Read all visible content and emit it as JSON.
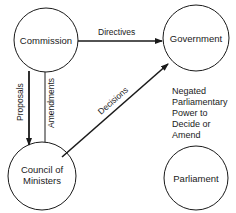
{
  "diagram": {
    "nodes": [
      {
        "id": "commission",
        "label": "Commission"
      },
      {
        "id": "government",
        "label": "Government"
      },
      {
        "id": "council",
        "label_lines": [
          "Council of",
          "Ministers"
        ]
      },
      {
        "id": "parliament",
        "label": "Parliament"
      }
    ],
    "edges": [
      {
        "from": "commission",
        "to": "government",
        "label": "Directives"
      },
      {
        "from": "commission",
        "to": "council",
        "label": "Proposals"
      },
      {
        "from": "council",
        "to": "commission",
        "label": "Amendments"
      },
      {
        "from": "council",
        "to": "government",
        "label": "Decisions"
      }
    ],
    "note": {
      "lines": [
        "Negated",
        "Parliamentary",
        "Power to",
        "Decide or",
        "Amend"
      ]
    },
    "colors": {
      "stroke": "#1a1a1a",
      "background": "#ffffff"
    }
  }
}
